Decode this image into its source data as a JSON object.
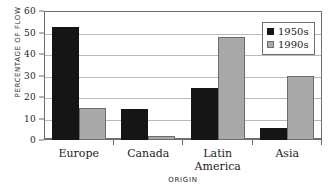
{
  "chart_data": {
    "type": "bar",
    "title": "",
    "xlabel": "ORIGIN",
    "ylabel": "PERCENTAGE OF FLOW",
    "categories": [
      "Europe",
      "Canada",
      "Latin\nAmerica",
      "Asia"
    ],
    "category_lines": [
      [
        "Europe"
      ],
      [
        "Canada"
      ],
      [
        "Latin",
        "America"
      ],
      [
        "Asia"
      ]
    ],
    "series": [
      {
        "name": "1950s",
        "color": "#151515",
        "values": [
          52.5,
          14.5,
          24,
          5.5
        ]
      },
      {
        "name": "1990s",
        "color": "#a8a8a8",
        "values": [
          15,
          2,
          48,
          30
        ]
      }
    ],
    "ylim": [
      0,
      60
    ],
    "yticks": [
      60,
      50,
      40,
      30,
      20,
      10,
      0
    ],
    "ytick_labels": [
      "60",
      "50",
      "40",
      "30",
      "20",
      "10",
      "0"
    ],
    "grid": true,
    "legend_position": "top-right",
    "legend_entries": [
      "1950s",
      "1990s"
    ]
  }
}
